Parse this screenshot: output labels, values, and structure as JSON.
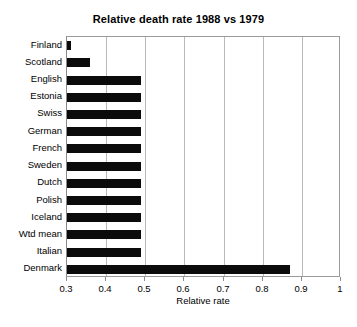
{
  "chart_data": {
    "type": "bar",
    "orientation": "horizontal",
    "title": "Relative death rate 1988 vs 1979",
    "xlabel": "Relative rate",
    "ylabel": "",
    "xlim": [
      0.3,
      1.0
    ],
    "xticks": [
      "0.3",
      "0.4",
      "0.5",
      "0.6",
      "0.7",
      "0.8",
      "0.9",
      "1"
    ],
    "xtick_values": [
      0.3,
      0.4,
      0.5,
      0.6,
      0.7,
      0.8,
      0.9,
      1.0
    ],
    "grid": "vertical",
    "legend": "none",
    "bar_color": "#0b0b0b",
    "categories": [
      "Finland",
      "Scotland",
      "English",
      "Estonia",
      "Swiss",
      "German",
      "French",
      "Sweden",
      "Dutch",
      "Polish",
      "Iceland",
      "Wtd mean",
      "Italian",
      "Denmark"
    ],
    "values": [
      0.31,
      0.36,
      0.49,
      0.49,
      0.49,
      0.49,
      0.49,
      0.49,
      0.49,
      0.49,
      0.49,
      0.49,
      0.49,
      0.87
    ]
  }
}
